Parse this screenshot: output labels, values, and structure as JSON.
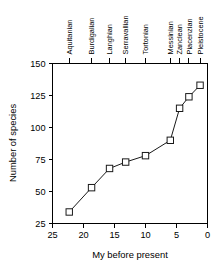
{
  "chart_data": {
    "type": "line",
    "title": "",
    "subtitle": "",
    "xlabel": "My before present",
    "ylabel": "Number of species",
    "xlim": [
      25,
      0
    ],
    "ylim": [
      25,
      150
    ],
    "x_reversed": true,
    "grid": false,
    "legend": "none",
    "xticks": [
      25,
      20,
      15,
      10,
      5,
      0
    ],
    "xtick_labels": [
      "25",
      "20",
      "15",
      "10",
      "5",
      "0"
    ],
    "yticks": [
      25,
      50,
      75,
      100,
      125,
      150
    ],
    "ytick_labels": [
      "25",
      "50",
      "75",
      "100",
      "125",
      "150"
    ],
    "marker": "open-square",
    "series": [
      {
        "name": "Number of species",
        "x": [
          22.3,
          18.7,
          15.8,
          13.2,
          10.0,
          6.0,
          4.5,
          3.0,
          1.2
        ],
        "values": [
          34,
          53,
          68,
          73,
          78,
          90,
          115,
          124,
          133
        ],
        "point_labels": [
          "Aquitanian",
          "Burdigalian",
          "Langhian",
          "Serravallian",
          "Tortonian",
          "Messinian",
          "Zanclean",
          "Piacenzian",
          "Pleistocene"
        ]
      }
    ],
    "top_axis": {
      "label": "Stages",
      "ticks": [
        22.3,
        18.7,
        15.8,
        13.2,
        10.0,
        6.0,
        4.5,
        3.0,
        1.2
      ],
      "tick_labels": [
        "Aquitanian",
        "Burdigalian",
        "Langhian",
        "Serravallian",
        "Tortonian",
        "Messinian",
        "Zanclean",
        "Piacenzian",
        "Pleistocene"
      ]
    }
  }
}
